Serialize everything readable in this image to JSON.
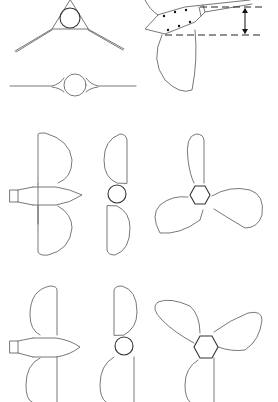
{
  "figure": {
    "type": "technical-drawing",
    "background": "#ffffff",
    "line_color": "#555555",
    "panels": [
      {
        "id": "three-blade-section",
        "description": "hub circle in triangular fairing with two swept blades"
      },
      {
        "id": "two-blade-section",
        "description": "hub circle with two straight blades"
      },
      {
        "id": "blade-root-detail",
        "description": "blade root with bolt pattern and dimension arrow between dashed lines"
      },
      {
        "id": "two-blade-side-view-a",
        "description": "side view with hub body and spinner"
      },
      {
        "id": "two-blade-front-view-a",
        "description": "front view with round hub"
      },
      {
        "id": "three-blade-front-view-a",
        "description": "front view with hexagonal hub"
      },
      {
        "id": "two-blade-side-view-b",
        "description": "side view with hub body and spinner"
      },
      {
        "id": "two-blade-front-view-b",
        "description": "front view with round hub"
      },
      {
        "id": "three-blade-front-view-b",
        "description": "front view with hexagonal hub, rotated"
      }
    ]
  }
}
